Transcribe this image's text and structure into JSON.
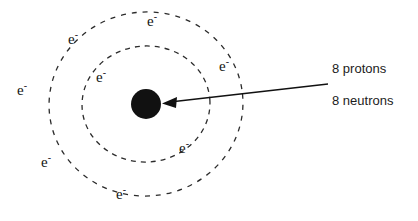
{
  "diagram": {
    "background_color": "#ffffff",
    "nucleus": {
      "name": "nucleus",
      "color": "#111111",
      "center_x": 146,
      "center_y": 104,
      "radius": 15
    },
    "shells": [
      {
        "name": "inner-shell",
        "center_x": 146,
        "center_y": 104,
        "rx": 64,
        "ry": 58,
        "stroke_color": "#2b2b2b",
        "dash": "5 5",
        "electron_count": 2
      },
      {
        "name": "outer-shell",
        "center_x": 146,
        "center_y": 104,
        "rx": 97,
        "ry": 92,
        "stroke_color": "#2b2b2b",
        "dash": "5 6",
        "electron_count": 6
      }
    ],
    "electrons": [
      {
        "id": "e1",
        "shell": "inner-shell",
        "symbol": "e",
        "charge": "-",
        "x": 101,
        "y": 76
      },
      {
        "id": "e2",
        "shell": "inner-shell",
        "symbol": "e",
        "charge": "-",
        "x": 184,
        "y": 147
      },
      {
        "id": "e3",
        "shell": "outer-shell",
        "symbol": "e",
        "charge": "-",
        "x": 73,
        "y": 38
      },
      {
        "id": "e4",
        "shell": "outer-shell",
        "symbol": "e",
        "charge": "-",
        "x": 152,
        "y": 20
      },
      {
        "id": "e5",
        "shell": "outer-shell",
        "symbol": "e",
        "charge": "-",
        "x": 224,
        "y": 65
      },
      {
        "id": "e6",
        "shell": "outer-shell",
        "symbol": "e",
        "charge": "-",
        "x": 22,
        "y": 89
      },
      {
        "id": "e7",
        "shell": "outer-shell",
        "symbol": "e",
        "charge": "-",
        "x": 46,
        "y": 161
      },
      {
        "id": "e8",
        "shell": "outer-shell",
        "symbol": "e",
        "charge": "-",
        "x": 121,
        "y": 193
      }
    ],
    "callout": {
      "name": "nucleus-callout",
      "arrow": {
        "name": "nucleus-arrow",
        "from_x": 328,
        "from_y": 84,
        "to_x": 164,
        "to_y": 103,
        "color": "#111111",
        "stroke_width": 1.4
      },
      "lines": [
        {
          "id": "protons",
          "text": "8 protons",
          "x": 332,
          "y": 62
        },
        {
          "id": "neutrons",
          "text": "8 neutrons",
          "x": 332,
          "y": 94
        }
      ]
    }
  }
}
